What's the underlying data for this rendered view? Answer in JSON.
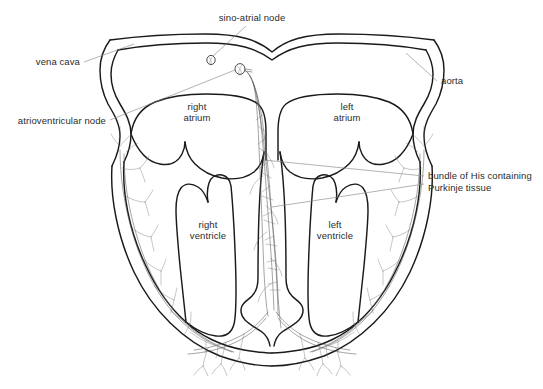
{
  "figure": {
    "type": "anatomical-line-diagram",
    "background_color": "#ffffff",
    "outline_color": "#1a1a1a",
    "fiber_color": "#555555",
    "leader_line_color": "#8a8a8a",
    "text_color": "#2b2b2b"
  },
  "labels": {
    "sino_atrial_node": "sino-atrial node",
    "vena_cava": "vena cava",
    "atrioventricular_node": "atrioventricular node",
    "aorta": "aorta",
    "right_atrium_line1": "right",
    "right_atrium_line2": "atrium",
    "left_atrium_line1": "left",
    "left_atrium_line2": "atrium",
    "right_ventricle_line1": "right",
    "right_ventricle_line2": "ventricle",
    "left_ventricle_line1": "left",
    "left_ventricle_line2": "ventricle",
    "bundle_of_his_line1": "bundle of His containing",
    "bundle_of_his_line2": "Purkinje tissue"
  },
  "markers": {
    "sa_node": "sino-atrial-node-marker",
    "av_node": "atrioventricular-node-marker"
  }
}
